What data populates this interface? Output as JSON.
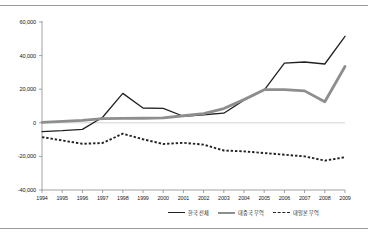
{
  "figure": {
    "background": "#ffffff",
    "rule_color": "#9a9a9a"
  },
  "chart_data": {
    "type": "line",
    "title": "",
    "subtitle": "",
    "xlabel": "",
    "ylabel": "",
    "grid": false,
    "zero_line": true,
    "legend_position": "bottom-right",
    "ylim": [
      -40000,
      60000
    ],
    "ytick_values": [
      60000,
      40000,
      20000,
      0,
      -20000,
      -40000
    ],
    "ytick_labels": [
      "60,000",
      "40,000",
      "20,000",
      "0",
      "-20,000",
      "-40,000"
    ],
    "categories": [
      "1994",
      "1995",
      "1996",
      "1997",
      "1998",
      "1999",
      "2000",
      "2001",
      "2002",
      "2003",
      "2004",
      "2005",
      "2006",
      "2007",
      "2008",
      "2009"
    ],
    "x": [
      1994,
      1995,
      1996,
      1997,
      1998,
      1999,
      2000,
      2001,
      2002,
      2003,
      2004,
      2005,
      2006,
      2007,
      2008,
      2009
    ],
    "series": [
      {
        "name": "한국 전체",
        "color": "#222222",
        "style": "solid",
        "width": 1.3,
        "values": [
          -5200,
          -4700,
          -3900,
          3300,
          17500,
          8800,
          8600,
          3900,
          4800,
          5700,
          13500,
          19500,
          35500,
          36200,
          35000,
          51500
        ]
      },
      {
        "name": "대중국 무역",
        "color": "#8e8e8e",
        "style": "solid",
        "width": 2.8,
        "values": [
          300,
          900,
          1500,
          2500,
          2600,
          2700,
          2900,
          4200,
          5400,
          8500,
          13800,
          19700,
          19700,
          19000,
          12500,
          33500
        ]
      },
      {
        "name": "대일본 무역",
        "color": "#222222",
        "style": "dotted",
        "width": 1.9,
        "values": [
          -8500,
          -10500,
          -12500,
          -12000,
          -6500,
          -9800,
          -12600,
          -11900,
          -13000,
          -16500,
          -17000,
          -18000,
          -19000,
          -20000,
          -22500,
          -20500
        ]
      }
    ]
  },
  "legend": {
    "items": [
      {
        "label": "한국 전체",
        "key": "solid-dark"
      },
      {
        "label": "대중국 무역",
        "key": "solid-gray"
      },
      {
        "label": "대일본 무역",
        "key": "dotted-dark"
      }
    ]
  }
}
